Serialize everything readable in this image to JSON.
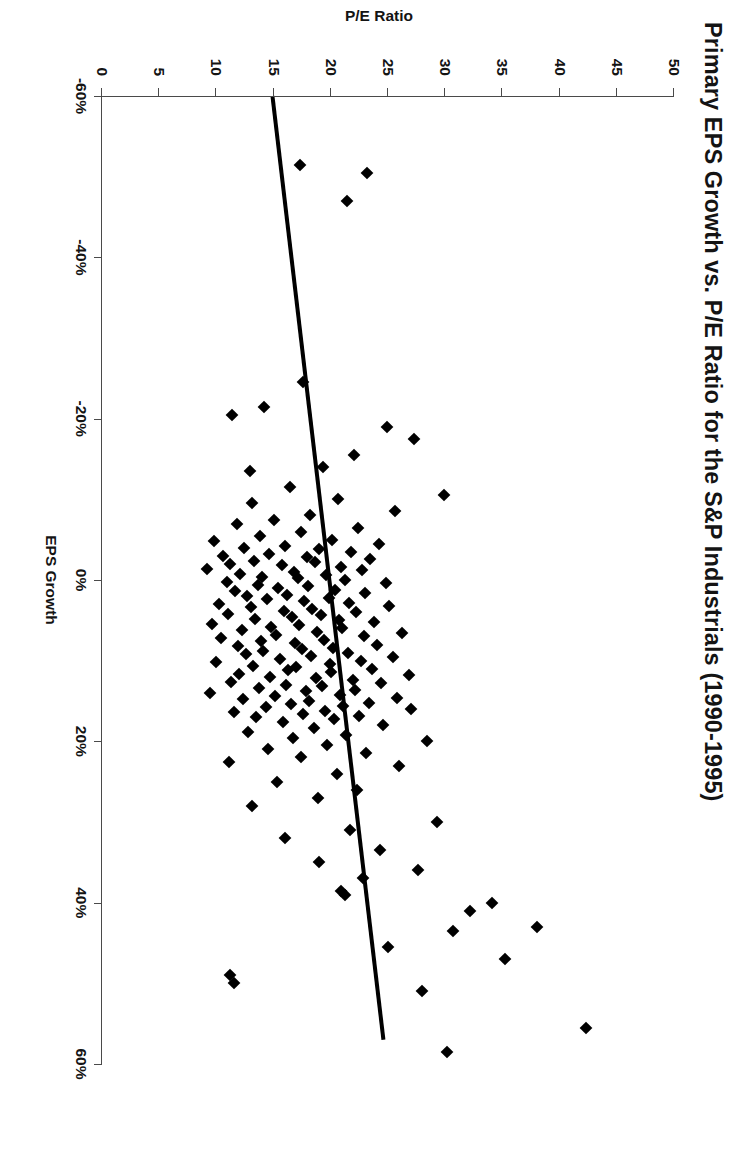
{
  "chart_data": {
    "type": "scatter",
    "title": "Primary EPS Growth vs. P/E Ratio for the S&P Industrials (1990-1995)",
    "xlabel": "EPS Growth",
    "ylabel": "P/E Ratio",
    "xlim": [
      -0.6,
      0.6
    ],
    "ylim": [
      0,
      50
    ],
    "grid": false,
    "legend": "none",
    "x_tick_labels": [
      "-60%",
      "-40%",
      "-20%",
      "0%",
      "20%",
      "40%",
      "60%"
    ],
    "x_tick_values": [
      -0.6,
      -0.4,
      -0.2,
      0.0,
      0.2,
      0.4,
      0.6
    ],
    "y_tick_labels": [
      "0",
      "5",
      "10",
      "15",
      "20",
      "25",
      "30",
      "35",
      "40",
      "45",
      "50"
    ],
    "y_tick_values": [
      0,
      5,
      10,
      15,
      20,
      25,
      30,
      35,
      40,
      45,
      50
    ],
    "marker_shape": "diamond",
    "marker_color": "#000000",
    "trendline": {
      "label": "linear regression fit",
      "color": "#000000",
      "width_px": 4,
      "x_start": -0.6,
      "y_start": 14.9,
      "x_end": 0.57,
      "y_end": 24.6
    },
    "series": [
      {
        "name": "S&P Industrials companies",
        "points": [
          [
            -0.515,
            17.3
          ],
          [
            -0.505,
            23.2
          ],
          [
            -0.47,
            21.4
          ],
          [
            -0.245,
            17.6
          ],
          [
            -0.215,
            14.2
          ],
          [
            -0.205,
            11.4
          ],
          [
            -0.19,
            24.9
          ],
          [
            -0.175,
            27.3
          ],
          [
            -0.155,
            22.0
          ],
          [
            -0.14,
            19.3
          ],
          [
            -0.135,
            12.9
          ],
          [
            -0.115,
            16.4
          ],
          [
            -0.105,
            29.9
          ],
          [
            -0.1,
            20.6
          ],
          [
            -0.095,
            13.1
          ],
          [
            -0.085,
            25.6
          ],
          [
            -0.08,
            18.2
          ],
          [
            -0.075,
            15.0
          ],
          [
            -0.07,
            11.8
          ],
          [
            -0.065,
            22.4
          ],
          [
            -0.06,
            17.4
          ],
          [
            -0.055,
            13.8
          ],
          [
            -0.05,
            20.1
          ],
          [
            -0.048,
            9.8
          ],
          [
            -0.045,
            24.2
          ],
          [
            -0.042,
            16.0
          ],
          [
            -0.04,
            12.4
          ],
          [
            -0.038,
            19.0
          ],
          [
            -0.035,
            21.8
          ],
          [
            -0.032,
            14.6
          ],
          [
            -0.03,
            10.6
          ],
          [
            -0.028,
            17.9
          ],
          [
            -0.026,
            23.4
          ],
          [
            -0.024,
            13.3
          ],
          [
            -0.022,
            18.6
          ],
          [
            -0.02,
            11.2
          ],
          [
            -0.018,
            15.7
          ],
          [
            -0.016,
            20.9
          ],
          [
            -0.014,
            9.2
          ],
          [
            -0.012,
            22.7
          ],
          [
            -0.01,
            16.8
          ],
          [
            -0.008,
            12.1
          ],
          [
            -0.006,
            19.6
          ],
          [
            -0.004,
            14.0
          ],
          [
            -0.002,
            17.1
          ],
          [
            0.0,
            21.2
          ],
          [
            0.002,
            10.9
          ],
          [
            0.004,
            24.8
          ],
          [
            0.006,
            13.6
          ],
          [
            0.008,
            18.0
          ],
          [
            0.01,
            15.4
          ],
          [
            0.012,
            20.4
          ],
          [
            0.014,
            11.6
          ],
          [
            0.016,
            23.0
          ],
          [
            0.018,
            16.2
          ],
          [
            0.02,
            12.7
          ],
          [
            0.022,
            19.8
          ],
          [
            0.024,
            14.4
          ],
          [
            0.026,
            17.7
          ],
          [
            0.028,
            21.6
          ],
          [
            0.03,
            10.2
          ],
          [
            0.032,
            25.1
          ],
          [
            0.034,
            13.0
          ],
          [
            0.036,
            18.4
          ],
          [
            0.038,
            15.9
          ],
          [
            0.04,
            22.2
          ],
          [
            0.042,
            11.0
          ],
          [
            0.044,
            19.1
          ],
          [
            0.046,
            16.6
          ],
          [
            0.048,
            13.4
          ],
          [
            0.05,
            20.7
          ],
          [
            0.052,
            23.8
          ],
          [
            0.054,
            9.6
          ],
          [
            0.056,
            17.2
          ],
          [
            0.058,
            14.8
          ],
          [
            0.06,
            21.0
          ],
          [
            0.062,
            12.2
          ],
          [
            0.064,
            18.8
          ],
          [
            0.066,
            26.2
          ],
          [
            0.068,
            15.2
          ],
          [
            0.07,
            22.9
          ],
          [
            0.072,
            10.4
          ],
          [
            0.074,
            19.4
          ],
          [
            0.076,
            13.9
          ],
          [
            0.078,
            16.9
          ],
          [
            0.08,
            24.0
          ],
          [
            0.082,
            11.9
          ],
          [
            0.084,
            20.2
          ],
          [
            0.086,
            17.5
          ],
          [
            0.088,
            14.1
          ],
          [
            0.09,
            21.5
          ],
          [
            0.092,
            12.6
          ],
          [
            0.094,
            18.3
          ],
          [
            0.096,
            25.4
          ],
          [
            0.098,
            15.6
          ],
          [
            0.1,
            22.6
          ],
          [
            0.102,
            10.0
          ],
          [
            0.104,
            19.9
          ],
          [
            0.106,
            13.2
          ],
          [
            0.108,
            17.0
          ],
          [
            0.11,
            23.6
          ],
          [
            0.112,
            16.3
          ],
          [
            0.114,
            20.0
          ],
          [
            0.116,
            12.0
          ],
          [
            0.118,
            26.8
          ],
          [
            0.12,
            14.7
          ],
          [
            0.122,
            18.7
          ],
          [
            0.124,
            21.9
          ],
          [
            0.126,
            11.3
          ],
          [
            0.128,
            24.4
          ],
          [
            0.13,
            16.1
          ],
          [
            0.132,
            19.2
          ],
          [
            0.134,
            13.7
          ],
          [
            0.136,
            22.1
          ],
          [
            0.138,
            17.8
          ],
          [
            0.14,
            9.4
          ],
          [
            0.142,
            20.8
          ],
          [
            0.144,
            15.1
          ],
          [
            0.146,
            25.8
          ],
          [
            0.148,
            12.3
          ],
          [
            0.15,
            18.1
          ],
          [
            0.152,
            23.3
          ],
          [
            0.154,
            16.5
          ],
          [
            0.156,
            21.1
          ],
          [
            0.158,
            14.3
          ],
          [
            0.16,
            27.0
          ],
          [
            0.162,
            19.5
          ],
          [
            0.164,
            11.5
          ],
          [
            0.166,
            17.6
          ],
          [
            0.168,
            22.5
          ],
          [
            0.17,
            13.5
          ],
          [
            0.172,
            20.3
          ],
          [
            0.176,
            15.8
          ],
          [
            0.18,
            24.6
          ],
          [
            0.184,
            18.5
          ],
          [
            0.188,
            12.8
          ],
          [
            0.192,
            21.3
          ],
          [
            0.196,
            16.7
          ],
          [
            0.2,
            28.4
          ],
          [
            0.205,
            19.7
          ],
          [
            0.21,
            14.5
          ],
          [
            0.215,
            23.1
          ],
          [
            0.22,
            17.4
          ],
          [
            0.225,
            11.1
          ],
          [
            0.23,
            26.0
          ],
          [
            0.24,
            20.5
          ],
          [
            0.25,
            15.3
          ],
          [
            0.26,
            22.3
          ],
          [
            0.27,
            18.9
          ],
          [
            0.28,
            13.1
          ],
          [
            0.3,
            29.3
          ],
          [
            0.31,
            21.7
          ],
          [
            0.32,
            16.0
          ],
          [
            0.335,
            24.3
          ],
          [
            0.35,
            19.0
          ],
          [
            0.36,
            27.6
          ],
          [
            0.37,
            22.8
          ],
          [
            0.385,
            20.9
          ],
          [
            0.39,
            21.2
          ],
          [
            0.4,
            34.1
          ],
          [
            0.41,
            32.2
          ],
          [
            0.43,
            38.0
          ],
          [
            0.435,
            30.7
          ],
          [
            0.455,
            25.0
          ],
          [
            0.47,
            35.2
          ],
          [
            0.49,
            11.2
          ],
          [
            0.5,
            11.5
          ],
          [
            0.51,
            28.0
          ],
          [
            0.555,
            42.3
          ],
          [
            0.585,
            30.2
          ]
        ]
      }
    ]
  }
}
